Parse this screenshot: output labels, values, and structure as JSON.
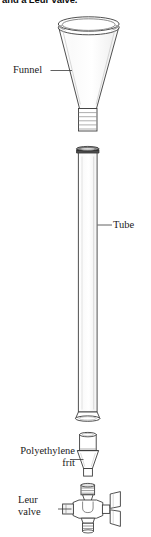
{
  "figure": {
    "caption_partial": "and a Leur valve.",
    "components": [
      {
        "id": "funnel",
        "label": "Funnel"
      },
      {
        "id": "tube",
        "label": "Tube"
      },
      {
        "id": "frit",
        "label": "Polyethylene\nfrit"
      },
      {
        "id": "valve",
        "label": "Leur\nvalve"
      }
    ],
    "labels": {
      "funnel": "Funnel",
      "tube": "Tube",
      "frit_line1": "Polyethylene",
      "frit_line2": "frit",
      "valve_line1": "Leur",
      "valve_line2": "valve"
    },
    "colors": {
      "background": "#ffffff",
      "ink": "#1b1b1b",
      "line": "#3a3a3a",
      "line_light": "#8a8a8a",
      "rim_shadow": "#2a2a2a",
      "fill": "#ffffff"
    },
    "canvas": {
      "width": 151,
      "height": 537
    }
  }
}
